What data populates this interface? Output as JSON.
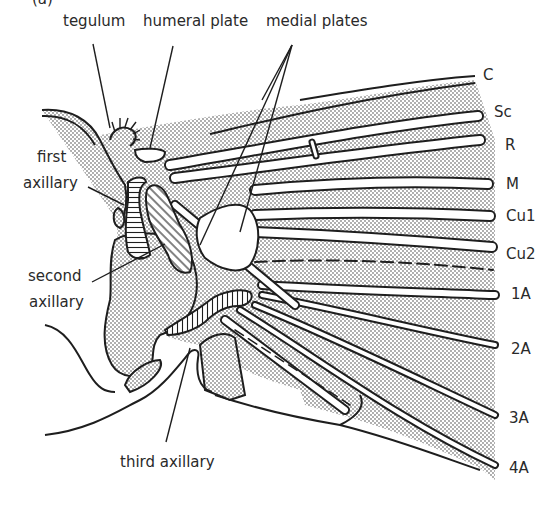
{
  "figure": {
    "panel_mark": "(a)",
    "colors": {
      "ink": "#1e1e1e",
      "stipple": "#9a9a9a",
      "membrane_fill": "#e6e6e6",
      "background": "#ffffff"
    }
  },
  "labels": {
    "top": [
      {
        "id": "tegulum",
        "text": "tegulum"
      },
      {
        "id": "humeral_plate",
        "text": "humeral plate"
      },
      {
        "id": "medial_plates",
        "text": "medial plates"
      }
    ],
    "left": [
      {
        "id": "first_axillary",
        "text": "first\naxillary",
        "line1": "first",
        "line2": "axillary"
      },
      {
        "id": "second_axillary",
        "text": "second\naxillary",
        "line1": "second",
        "line2": "axillary"
      }
    ],
    "bottom": [
      {
        "id": "third_axillary",
        "text": "third axillary"
      }
    ]
  },
  "veins": [
    {
      "id": "C",
      "text": "C"
    },
    {
      "id": "Sc",
      "text": "Sc"
    },
    {
      "id": "R",
      "text": "R"
    },
    {
      "id": "M",
      "text": "M"
    },
    {
      "id": "Cu1",
      "text": "Cu1"
    },
    {
      "id": "Cu2",
      "text": "Cu2"
    },
    {
      "id": "1A",
      "text": "1A"
    },
    {
      "id": "2A",
      "text": "2A"
    },
    {
      "id": "3A",
      "text": "3A"
    },
    {
      "id": "4A",
      "text": "4A"
    }
  ]
}
